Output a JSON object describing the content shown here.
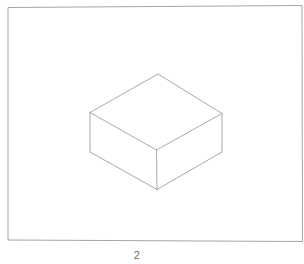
{
  "figure": {
    "caption": "2",
    "background_color": "#ffffff",
    "frame": {
      "stroke_color": "#9a9a9a",
      "stroke_width": 0.9,
      "points": "8,240 8,7.5 302,5.5 302.5,241.5 8,240"
    },
    "shape": {
      "name": "isometric-box",
      "stroke_color": "#9a9a9a",
      "stroke_width": 0.85,
      "vertices": {
        "top_apex": "158,74",
        "top_left": "90,112.5",
        "top_right": "222,113.5",
        "top_front": "156.5,150",
        "bottom_left": "90,152",
        "bottom_right": "222,152",
        "bottom_front": "157,189.5"
      },
      "top_face_path": "158,74 90,112.5 156.5,150 222,113.5 158,74",
      "left_face_path": "90,112.5 90,152 157,189.5 156.5,150 90,112.5",
      "right_face_path": "156.5,150 157,189.5 222,152 222,113.5 156.5,150",
      "edges": [
        "M158,74 L90,112.5",
        "M158,74 L222,113.5",
        "M90,112.5 L156.5,150",
        "M222,113.5 L156.5,150",
        "M90,112.5 L90,152",
        "M222,113.5 L222,152",
        "M156.5,150 L157,189.5",
        "M90,152 L157,189.5",
        "M222,152 L157,189.5"
      ]
    },
    "caption_position": {
      "x": "137",
      "y": "259"
    }
  }
}
